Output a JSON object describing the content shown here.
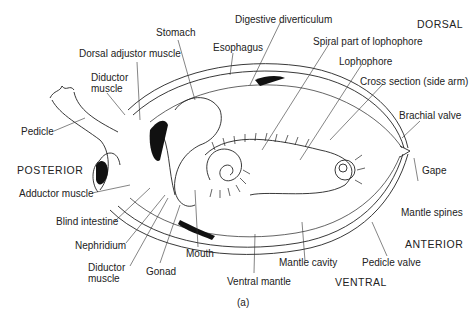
{
  "diagram": {
    "caption": "(a)",
    "orientation": {
      "dorsal": "DORSAL",
      "ventral": "VENTRAL",
      "anterior": "ANTERIOR",
      "posterior": "POSTERIOR"
    },
    "labels": {
      "digestive_diverticulum": "Digestive diverticulum",
      "stomach": "Stomach",
      "esophagus": "Esophagus",
      "dorsal_adjustor_muscle": "Dorsal adjustor muscle",
      "diductor_muscle_top_1": "Diductor",
      "diductor_muscle_top_2": "muscle",
      "spiral_part_of_lophophore": "Spiral part of lophophore",
      "lophophore": "Lophophore",
      "cross_section": "Cross section (side arm)",
      "brachial_valve": "Brachial valve",
      "pedicle": "Pedicle",
      "gape": "Gape",
      "mantle_spines": "Mantle spines",
      "adductor_muscle": "Adductor muscle",
      "blind_intestine": "Blind intestine",
      "nephridium": "Nephridium",
      "diductor_muscle_bottom_1": "Diductor",
      "diductor_muscle_bottom_2": "muscle",
      "gonad": "Gonad",
      "mouth": "Mouth",
      "ventral_mantle": "Ventral mantle",
      "mantle_cavity": "Mantle cavity",
      "pedicle_valve": "Pedicle valve"
    }
  }
}
